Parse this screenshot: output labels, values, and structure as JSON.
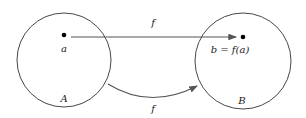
{
  "diagram": {
    "type": "function-mapping",
    "sets": [
      {
        "name": "A",
        "element": "a"
      },
      {
        "name": "B",
        "element": "b = f(a)"
      }
    ],
    "arrows": [
      {
        "label": "f",
        "from": "a",
        "to": "b = f(a)",
        "style": "straight"
      },
      {
        "label": "f",
        "from": "A",
        "to": "B",
        "style": "curved"
      }
    ],
    "colors": {
      "stroke": "#333333",
      "arrow": "#555555",
      "background": "#ffffff"
    }
  }
}
